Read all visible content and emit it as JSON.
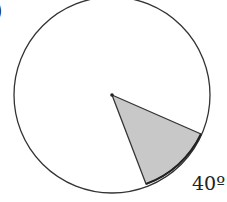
{
  "diagram": {
    "type": "circle-sector",
    "circle": {
      "cx": 112,
      "cy": 95,
      "r": 98,
      "stroke": "#333333",
      "fill": "#ffffff"
    },
    "sector": {
      "center": [
        112,
        95
      ],
      "start_point": [
        201,
        134
      ],
      "end_point": [
        146,
        184
      ],
      "fill": "#c8c8c8",
      "stroke": "#333333",
      "angle_label": "40º"
    },
    "partial_mark": ")"
  }
}
